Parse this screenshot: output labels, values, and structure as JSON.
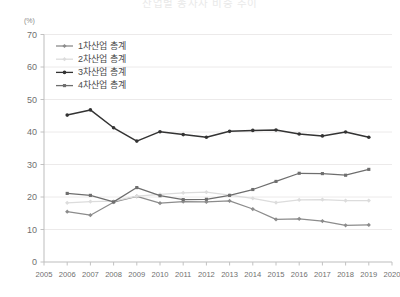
{
  "chart_data": {
    "type": "line",
    "title": "산업별 종사자 비중 추이",
    "unit_label": "(%)",
    "xlabel": "",
    "ylabel": "",
    "ylim": [
      0,
      70
    ],
    "ytick_step": 10,
    "yticks": [
      0,
      10,
      20,
      30,
      40,
      50,
      60,
      70
    ],
    "xlim": [
      2005,
      2020
    ],
    "xticks": [
      2005,
      2006,
      2007,
      2008,
      2009,
      2010,
      2011,
      2012,
      2013,
      2014,
      2015,
      2016,
      2017,
      2018,
      2019,
      2020
    ],
    "x": [
      2006,
      2007,
      2008,
      2009,
      2010,
      2011,
      2012,
      2013,
      2014,
      2015,
      2016,
      2017,
      2018,
      2019
    ],
    "grid": true,
    "legend_position": "upper-left",
    "series": [
      {
        "name": "1차산업 총계",
        "color": "#8c8c8c",
        "marker": "diamond",
        "values": [
          15.5,
          14.4,
          18.4,
          20.2,
          18.1,
          18.6,
          18.5,
          18.8,
          16.3,
          13.1,
          13.3,
          12.6,
          11.3,
          11.4
        ]
      },
      {
        "name": "2차산업 총계",
        "color": "#dcdcdc",
        "marker": "diamond",
        "values": [
          18.2,
          18.6,
          18.7,
          20.3,
          20.8,
          21.3,
          21.5,
          20.6,
          19.6,
          18.3,
          19.1,
          19.2,
          18.9,
          18.9
        ]
      },
      {
        "name": "3차산업 총계",
        "color": "#333333",
        "marker": "circle",
        "values": [
          45.2,
          46.8,
          41.3,
          37.2,
          40.1,
          39.2,
          38.4,
          40.2,
          40.5,
          40.6,
          39.4,
          38.8,
          40.0,
          38.4
        ]
      },
      {
        "name": "4차산업 총계",
        "color": "#6e6e6e",
        "marker": "square",
        "values": [
          21.1,
          20.5,
          18.5,
          22.9,
          20.4,
          19.2,
          19.3,
          20.5,
          22.3,
          24.8,
          27.3,
          27.2,
          26.7,
          28.5
        ]
      }
    ]
  }
}
